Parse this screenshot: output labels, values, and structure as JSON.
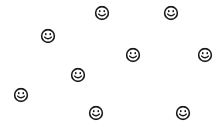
{
  "scene": {
    "name": "smiley-face-scatter",
    "width": 220,
    "height": 127,
    "background_color": "#FFFFFF",
    "ink_color": "#1A1A1A",
    "item_count": 9,
    "item_icon_name": "smiley-face-icon",
    "item_glyph": "☺"
  },
  "faces": [
    {
      "id": 1,
      "label": "smiley-1",
      "x": 102,
      "y": 13,
      "size": 15
    },
    {
      "id": 2,
      "label": "smiley-2",
      "x": 171,
      "y": 13,
      "size": 15
    },
    {
      "id": 3,
      "label": "smiley-3",
      "x": 48,
      "y": 36,
      "size": 15
    },
    {
      "id": 4,
      "label": "smiley-4",
      "x": 133,
      "y": 55,
      "size": 15
    },
    {
      "id": 5,
      "label": "smiley-5",
      "x": 205,
      "y": 55,
      "size": 15
    },
    {
      "id": 6,
      "label": "smiley-6",
      "x": 78,
      "y": 75,
      "size": 15
    },
    {
      "id": 7,
      "label": "smiley-7",
      "x": 21,
      "y": 95,
      "size": 15
    },
    {
      "id": 8,
      "label": "smiley-8",
      "x": 96,
      "y": 113,
      "size": 15
    },
    {
      "id": 9,
      "label": "smiley-9",
      "x": 183,
      "y": 113,
      "size": 15
    }
  ]
}
